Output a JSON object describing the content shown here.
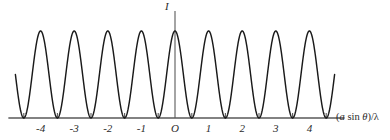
{
  "figure": {
    "name": "two-slit-interference-intensity-pattern",
    "background_color": "#ffffff",
    "curve_color": "#1a1a1a",
    "axis_color": "#595959",
    "text_color": "#2b2b2b"
  },
  "axes": {
    "y_axis_label": "I",
    "x_axis_label_full": "(a sin θ)/λ",
    "x_axis_label_parts": {
      "open_paren": "(",
      "slit_sep": "a",
      "sin": " sin ",
      "theta": "θ",
      "close_paren": ")/",
      "lambda": "λ"
    },
    "origin_label": "O",
    "x_tick_labels": [
      "-4",
      "-3",
      "-2",
      "-1",
      "O",
      "1",
      "2",
      "3",
      "4"
    ],
    "x_tick_label_values": [
      -4,
      -3,
      -2,
      -1,
      0,
      1,
      2,
      3,
      4
    ],
    "x_minor_tick_values": [
      -4.5,
      -3.5,
      -2.5,
      -1.5,
      -0.5,
      0.5,
      1.5,
      2.5,
      3.5,
      4.5
    ],
    "x_axis_pixel_y": 118,
    "y_axis_pixel_x": 175,
    "x_range_plotted": [
      -4.75,
      4.75
    ]
  },
  "chart_data": {
    "type": "line",
    "title": "",
    "subtitle": "",
    "xlabel": "(a sin θ)/λ",
    "ylabel": "I",
    "grid": false,
    "legend": "none",
    "xlim": [
      -4.9,
      4.9
    ],
    "ylim": [
      0,
      1.08
    ],
    "function": "I = I_max * cos^2(pi * (a sin(theta))/lambda)",
    "maxima_x": [
      -4,
      -3,
      -2,
      -1,
      0,
      1,
      2,
      3,
      4
    ],
    "maxima_y": [
      1,
      1,
      1,
      1,
      1,
      1,
      1,
      1,
      1
    ],
    "minima_x": [
      -4.5,
      -3.5,
      -2.5,
      -1.5,
      -0.5,
      0.5,
      1.5,
      2.5,
      3.5,
      4.5
    ],
    "minima_y": [
      0,
      0,
      0,
      0,
      0,
      0,
      0,
      0,
      0,
      0
    ],
    "series": [
      {
        "name": "Intensity I",
        "x": [
          -4.75,
          -4.6,
          -4.5,
          -4.4,
          -4.25,
          -4.1,
          -4.0,
          -3.9,
          -3.75,
          -3.6,
          -3.5,
          -3.4,
          -3.25,
          -3.1,
          -3.0,
          -2.9,
          -2.75,
          -2.6,
          -2.5,
          -2.4,
          -2.25,
          -2.1,
          -2.0,
          -1.9,
          -1.75,
          -1.6,
          -1.5,
          -1.4,
          -1.25,
          -1.1,
          -1.0,
          -0.9,
          -0.75,
          -0.6,
          -0.5,
          -0.4,
          -0.25,
          -0.1,
          0.0,
          0.1,
          0.25,
          0.4,
          0.5,
          0.6,
          0.75,
          0.9,
          1.0,
          1.1,
          1.25,
          1.4,
          1.5,
          1.6,
          1.75,
          1.9,
          2.0,
          2.1,
          2.25,
          2.4,
          2.5,
          2.6,
          2.75,
          2.9,
          3.0,
          3.1,
          3.25,
          3.4,
          3.5,
          3.6,
          3.75,
          3.9,
          4.0,
          4.1,
          4.25,
          4.4,
          4.5,
          4.6,
          4.75
        ],
        "y": [
          0.46,
          0.1,
          0.0,
          0.1,
          0.5,
          0.9,
          1.0,
          0.9,
          0.5,
          0.1,
          0.0,
          0.1,
          0.5,
          0.9,
          1.0,
          0.9,
          0.5,
          0.1,
          0.0,
          0.1,
          0.5,
          0.9,
          1.0,
          0.9,
          0.5,
          0.1,
          0.0,
          0.1,
          0.5,
          0.9,
          1.0,
          0.9,
          0.5,
          0.1,
          0.0,
          0.1,
          0.5,
          0.9,
          1.0,
          0.9,
          0.5,
          0.1,
          0.0,
          0.1,
          0.5,
          0.9,
          1.0,
          0.9,
          0.5,
          0.1,
          0.0,
          0.1,
          0.5,
          0.9,
          1.0,
          0.9,
          0.5,
          0.1,
          0.0,
          0.1,
          0.5,
          0.9,
          1.0,
          0.9,
          0.5,
          0.1,
          0.0,
          0.1,
          0.5,
          0.9,
          1.0,
          0.9,
          0.5,
          0.1,
          0.0,
          0.1,
          0.46
        ]
      }
    ]
  }
}
